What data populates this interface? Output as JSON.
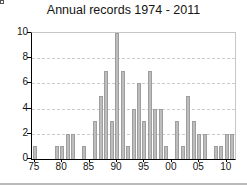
{
  "window": {
    "background": "#ffffff",
    "bottom_border_color": "#b9b9b9"
  },
  "chart_data": {
    "type": "bar",
    "title": "Annual records 1974 - 2011",
    "xlabel": "",
    "ylabel": "",
    "x": [
      1975,
      1976,
      1977,
      1978,
      1979,
      1980,
      1981,
      1982,
      1983,
      1984,
      1985,
      1986,
      1987,
      1988,
      1989,
      1990,
      1991,
      1992,
      1993,
      1994,
      1995,
      1996,
      1997,
      1998,
      1999,
      2000,
      2001,
      2002,
      2003,
      2004,
      2005,
      2006,
      2007,
      2008,
      2009,
      2010,
      2011
    ],
    "values": [
      1,
      0,
      0,
      0,
      1,
      1,
      2,
      2,
      0,
      1,
      0,
      3,
      5,
      7,
      3,
      10,
      7,
      1,
      4,
      6,
      3,
      7,
      4,
      4,
      1,
      0,
      3,
      1,
      5,
      3,
      2,
      2,
      0,
      1,
      1,
      2,
      2
    ],
    "ylim": [
      0,
      10
    ],
    "yticks": [
      0,
      2,
      4,
      6,
      8,
      10
    ],
    "xticks": [
      {
        "year": 1975,
        "label": "75"
      },
      {
        "year": 1980,
        "label": "80"
      },
      {
        "year": 1985,
        "label": "85"
      },
      {
        "year": 1990,
        "label": "90"
      },
      {
        "year": 1995,
        "label": "95"
      },
      {
        "year": 2000,
        "label": "00"
      },
      {
        "year": 2005,
        "label": "05"
      },
      {
        "year": 2010,
        "label": "10"
      }
    ],
    "grid": "horizontal dashed at 2,4,6,8",
    "legend": "none",
    "colors": {
      "bar_fill": "#bdbdbd",
      "bar_border": "#9e9e9e",
      "gridline": "#cccccc",
      "axis": "#000000",
      "frame": "#c6c6c6",
      "text": "#141414"
    }
  }
}
